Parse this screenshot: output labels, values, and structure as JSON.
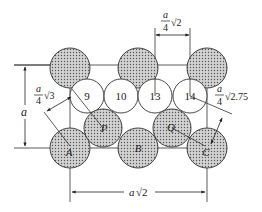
{
  "figure": {
    "colors": {
      "stroke": "#333333",
      "shaded_fill": "#c8c8c8",
      "dot": "#555555",
      "white_fill": "#ffffff"
    }
  },
  "shaded_atoms": [
    {
      "id": "top-left",
      "label": "",
      "cx": 70,
      "cy": 68,
      "r": 20
    },
    {
      "id": "top-middle",
      "label": "",
      "cx": 138,
      "cy": 68,
      "r": 20
    },
    {
      "id": "top-right",
      "label": "",
      "cx": 207,
      "cy": 68,
      "r": 20
    },
    {
      "id": "A",
      "label": "A",
      "cx": 70,
      "cy": 148,
      "r": 20
    },
    {
      "id": "B",
      "label": "B",
      "cx": 138,
      "cy": 148,
      "r": 20
    },
    {
      "id": "C",
      "label": "C",
      "cx": 207,
      "cy": 148,
      "r": 20
    },
    {
      "id": "P",
      "label": "P",
      "cx": 103,
      "cy": 128,
      "r": 19
    },
    {
      "id": "Q",
      "label": "Q",
      "cx": 172,
      "cy": 128,
      "r": 19
    }
  ],
  "white_sites": [
    {
      "id": "9",
      "label": "9",
      "cx": 87,
      "cy": 96,
      "r": 17
    },
    {
      "id": "10",
      "label": "10",
      "cx": 121,
      "cy": 96,
      "r": 17
    },
    {
      "id": "13",
      "label": "13",
      "cx": 155,
      "cy": 96,
      "r": 17
    },
    {
      "id": "14",
      "label": "14",
      "cx": 190,
      "cy": 96,
      "r": 17
    }
  ],
  "dimensions": {
    "left_height": {
      "var": "a",
      "text": ""
    },
    "top_spacing": {
      "num": "a",
      "den": "4",
      "root": "√2"
    },
    "left_diagonal": {
      "num": "a",
      "den": "4",
      "root": "√3"
    },
    "right_diagonal": {
      "num": "a",
      "den": "4",
      "root": "√2.75"
    },
    "bottom_width": {
      "var": "a",
      "root": "√2"
    }
  }
}
